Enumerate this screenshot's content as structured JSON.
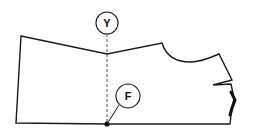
{
  "diagram": {
    "type": "sewing-pattern-piece",
    "colors": {
      "line": "#1a1a1a",
      "dashed_line": "#555555",
      "background": "#ffffff"
    },
    "labels": [
      {
        "id": "Y",
        "text": "Y"
      },
      {
        "id": "F",
        "text": "F"
      }
    ]
  }
}
